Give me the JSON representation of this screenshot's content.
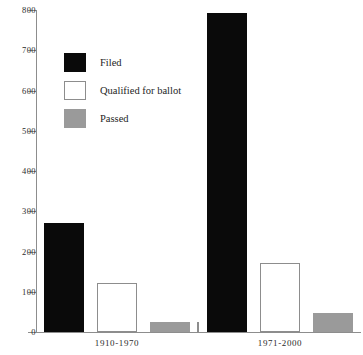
{
  "chart_data": {
    "type": "bar",
    "title": "",
    "subtitle": "",
    "xlabel": "",
    "ylabel": "",
    "categories": [
      "1910-1970",
      "1971-2000"
    ],
    "series": [
      {
        "name": "Filed",
        "color": "#0a0a0a",
        "values": [
          272,
          793
        ]
      },
      {
        "name": "Qualified for ballot",
        "color": "#ffffff",
        "values": [
          122,
          171
        ]
      },
      {
        "name": "Passed",
        "color": "#9a9a9a",
        "values": [
          25,
          47
        ]
      }
    ],
    "ylim": [
      0,
      800
    ],
    "ytick_step": 100,
    "yticks": [
      0,
      100,
      200,
      300,
      400,
      500,
      600,
      700,
      800
    ],
    "ytick_labels": [
      "0",
      "100",
      "200",
      "300",
      "400",
      "500",
      "600",
      "700",
      "800"
    ],
    "grid": false,
    "legend_position": "upper-left",
    "annotations": []
  },
  "legend": {
    "items": [
      {
        "label": "Filed",
        "swatch": "filed"
      },
      {
        "label": "Qualified for ballot",
        "swatch": "qualified"
      },
      {
        "label": "Passed",
        "swatch": "passed"
      }
    ]
  },
  "axes": {
    "y_axis_name": "y-axis",
    "x_axis_name": "x-axis"
  }
}
